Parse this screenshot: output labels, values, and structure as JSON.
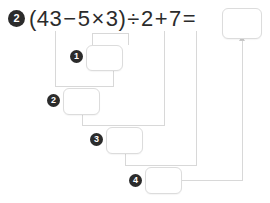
{
  "problem": {
    "number_label": "2",
    "expression_tokens": [
      {
        "t": "(",
        "kind": "paren"
      },
      {
        "t": "43",
        "kind": "num"
      },
      {
        "t": "−",
        "kind": "op"
      },
      {
        "t": "5",
        "kind": "num"
      },
      {
        "t": "×",
        "kind": "op"
      },
      {
        "t": "3",
        "kind": "num"
      },
      {
        "t": ")",
        "kind": "paren"
      },
      {
        "t": "÷",
        "kind": "op"
      },
      {
        "t": "2",
        "kind": "num"
      },
      {
        "t": "+",
        "kind": "op"
      },
      {
        "t": "7",
        "kind": "num"
      },
      {
        "t": "=",
        "kind": "op"
      }
    ],
    "expression_text": "(43 − 5 × 3) ÷ 2 + 7 ="
  },
  "answer_box": {
    "value": "",
    "placeholder": ""
  },
  "steps": [
    {
      "number_label": "1",
      "value": "",
      "placeholder": ""
    },
    {
      "number_label": "2",
      "value": "",
      "placeholder": ""
    },
    {
      "number_label": "3",
      "value": "",
      "placeholder": ""
    },
    {
      "number_label": "4",
      "value": "",
      "placeholder": ""
    }
  ],
  "colors": {
    "badge_bg": "#2b2b2b",
    "badge_text": "#ffffff",
    "text": "#2b2b2b",
    "box_border": "#dcdcdc",
    "connector": "#d8d8d8",
    "background": "#ffffff"
  }
}
